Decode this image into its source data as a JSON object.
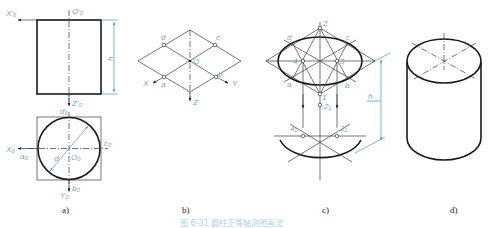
{
  "figure": {
    "caption": "图 6-31 圆柱正等轴测图画法",
    "panels": [
      {
        "id": "a",
        "label": "a)",
        "front_view": {
          "axis_x": "X'₀",
          "origin": "O'₀",
          "axis_z": "Z'₀",
          "height_dim": "h"
        },
        "top_view": {
          "axis_x": "X₀",
          "axis_y": "Y₀",
          "origin": "O₀",
          "points": [
            "a₀",
            "b₀",
            "c₀",
            "d₀"
          ],
          "diameter_dim": "d"
        }
      },
      {
        "id": "b",
        "label": "b)",
        "axes": [
          "X",
          "Y",
          "Z"
        ],
        "origin": "O",
        "points": [
          "a",
          "b",
          "c",
          "d"
        ]
      },
      {
        "id": "c",
        "label": "c)",
        "points_top": [
          "1",
          "2",
          "3",
          "4",
          "a",
          "b",
          "c",
          "d"
        ],
        "points_bottom": [
          "2₁",
          "3₁",
          "4₁"
        ],
        "height_dim": "h"
      },
      {
        "id": "d",
        "label": "d)"
      }
    ]
  },
  "colors": {
    "line": "#1a1a1a",
    "annotation": "#6fa6d0",
    "dimension": "#4a90c8"
  }
}
